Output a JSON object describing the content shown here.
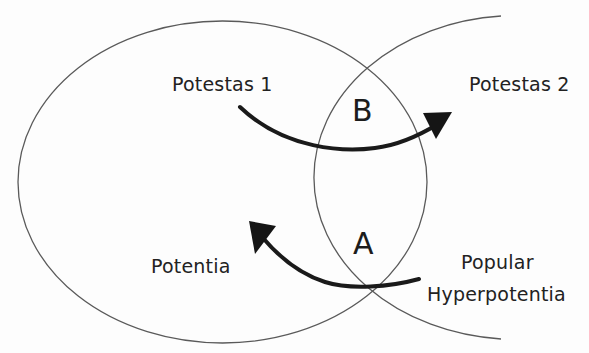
{
  "diagram": {
    "type": "venn",
    "sets": [
      {
        "id": "left",
        "description": "large left ellipse"
      },
      {
        "id": "right",
        "description": "right circle (left portion visible)"
      }
    ],
    "labels": {
      "potestas1": "Potestas 1",
      "potestas2": "Potestas 2",
      "potentia": "Potentia",
      "popular_line1": "Popular",
      "popular_line2": "Hyperpotentia"
    },
    "regions": {
      "b": "B",
      "a": "A"
    },
    "arrows": [
      {
        "id": "arrow-b",
        "from": "Potestas 1",
        "to": "Potestas 2",
        "through": "B"
      },
      {
        "id": "arrow-a",
        "from": "Popular Hyperpotentia",
        "to": "Potentia",
        "through": "A"
      }
    ],
    "colors": {
      "outline": "#555555",
      "arrow": "#1a1a1a",
      "text": "#222222",
      "background": "#fdfdfd"
    }
  }
}
